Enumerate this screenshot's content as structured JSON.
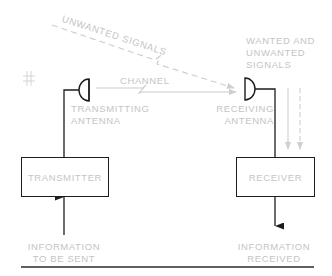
{
  "diagram": {
    "type": "communication-system-block-diagram",
    "labels": {
      "unwanted_signals": "UNWANTED SIGNALS",
      "channel": "CHANNEL",
      "transmitting_antenna_line1": "TRANSMITTING",
      "transmitting_antenna_line2": "ANTENNA",
      "receiving_antenna_line1": "RECEIVING",
      "receiving_antenna_line2": "ANTENNA",
      "wanted_unwanted_line1": "WANTED AND",
      "wanted_unwanted_line2": "UNWANTED",
      "wanted_unwanted_line3": "SIGNALS",
      "info_sent_line1": "INFORMATION",
      "info_sent_line2": "TO BE SENT",
      "info_received_line1": "INFORMATION",
      "info_received_line2": "RECEIVED",
      "hash_mark": "#"
    },
    "blocks": {
      "transmitter": "TRANSMITTER",
      "receiver": "RECEIVER"
    },
    "nodes": [
      "INFORMATION TO BE SENT",
      "TRANSMITTER",
      "TRANSMITTING ANTENNA",
      "CHANNEL",
      "RECEIVING ANTENNA",
      "RECEIVER",
      "INFORMATION RECEIVED"
    ],
    "edges": [
      {
        "from": "INFORMATION TO BE SENT",
        "to": "TRANSMITTER"
      },
      {
        "from": "TRANSMITTER",
        "to": "TRANSMITTING ANTENNA"
      },
      {
        "from": "TRANSMITTING ANTENNA",
        "to": "RECEIVING ANTENNA",
        "label": "CHANNEL"
      },
      {
        "from": "UNWANTED SIGNALS",
        "to": "RECEIVING ANTENNA",
        "style": "dashed"
      },
      {
        "from": "RECEIVING ANTENNA",
        "to": "RECEIVER"
      },
      {
        "from": "RECEIVER",
        "to": "INFORMATION RECEIVED"
      }
    ],
    "colors": {
      "line_dark": "#1c1c1c",
      "line_light": "#c8c8c8",
      "text_light": "#c4c4c4"
    }
  }
}
